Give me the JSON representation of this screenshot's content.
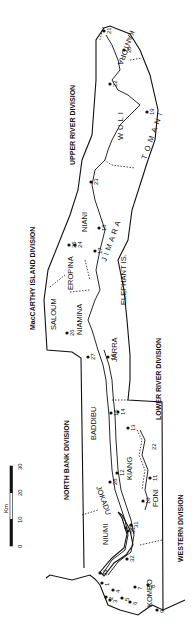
{
  "map": {
    "title": "The Gambia — Administrative Divisions",
    "orientation": "rotated 90deg counter-clockwise",
    "divisions": [
      {
        "name": "UPPER RIVER DIVISION",
        "x": 72,
        "y": 120
      },
      {
        "name": "MacCARTHY ISLAND DIVISION",
        "x": 32,
        "y": 270
      },
      {
        "name": "LOWER RIVER DIVISION",
        "x": 158,
        "y": 390
      },
      {
        "name": "NORTH BANK DIVISION",
        "x": 66,
        "y": 480
      },
      {
        "name": "WESTERN DIVISION",
        "x": 180,
        "y": 560
      }
    ],
    "regions": [
      {
        "name": "KANTORA",
        "x": 133,
        "y": 50
      },
      {
        "name": "WULI",
        "x": 120,
        "y": 125
      },
      {
        "name": "TOMANI",
        "x": 150,
        "y": 140
      },
      {
        "name": "NIANI",
        "x": 85,
        "y": 225
      },
      {
        "name": "JIMARA",
        "x": 112,
        "y": 245
      },
      {
        "name": "EROPINA",
        "x": 70,
        "y": 272
      },
      {
        "name": "ELEPHANT IS.",
        "x": 123,
        "y": 283
      },
      {
        "name": "SALOUM",
        "x": 55,
        "y": 325
      },
      {
        "name": "NIAMINA",
        "x": 80,
        "y": 310
      },
      {
        "name": "JARRA",
        "x": 115,
        "y": 355
      },
      {
        "name": "BADDIBU",
        "x": 93,
        "y": 420
      },
      {
        "name": "KIANG",
        "x": 130,
        "y": 468
      },
      {
        "name": "JOKADU",
        "x": 98,
        "y": 497
      },
      {
        "name": "NIUMI",
        "x": 105,
        "y": 537
      },
      {
        "name": "FONI",
        "x": 155,
        "y": 500
      },
      {
        "name": "KOMBO",
        "x": 150,
        "y": 595
      }
    ],
    "points": [
      {
        "id": "1",
        "x": 102,
        "y": 583
      },
      {
        "id": "2",
        "x": 106,
        "y": 597
      },
      {
        "id": "3",
        "x": 110,
        "y": 600
      },
      {
        "id": "4",
        "x": 113,
        "y": 590
      },
      {
        "id": "5",
        "x": 122,
        "y": 598
      },
      {
        "id": "6",
        "x": 130,
        "y": 602
      },
      {
        "id": "7",
        "x": 135,
        "y": 587
      },
      {
        "id": "8",
        "x": 148,
        "y": 585
      },
      {
        "id": "9",
        "x": 157,
        "y": 610
      },
      {
        "id": "10",
        "x": 143,
        "y": 501
      },
      {
        "id": "11",
        "x": 150,
        "y": 478
      },
      {
        "id": "12",
        "x": 117,
        "y": 473
      },
      {
        "id": "13",
        "x": 128,
        "y": 428
      },
      {
        "id": "14",
        "x": 118,
        "y": 412
      },
      {
        "id": "15",
        "x": 111,
        "y": 413
      },
      {
        "id": "16",
        "x": 108,
        "y": 357
      },
      {
        "id": "17",
        "x": 95,
        "y": 251
      },
      {
        "id": "18",
        "x": 99,
        "y": 228
      },
      {
        "id": "19",
        "x": 147,
        "y": 112
      },
      {
        "id": "20",
        "x": 124,
        "y": 50
      },
      {
        "id": "21",
        "x": 104,
        "y": 31
      },
      {
        "id": "22",
        "x": 110,
        "y": 84
      },
      {
        "id": "23",
        "x": 91,
        "y": 182
      },
      {
        "id": "24",
        "x": 75,
        "y": 245
      },
      {
        "id": "25",
        "x": 69,
        "y": 245
      },
      {
        "id": "26",
        "x": 67,
        "y": 333
      },
      {
        "id": "27",
        "x": 88,
        "y": 357
      },
      {
        "id": "28",
        "x": 110,
        "y": 482
      },
      {
        "id": "29",
        "x": 126,
        "y": 528
      },
      {
        "id": "30",
        "x": 128,
        "y": 531
      },
      {
        "id": "31",
        "x": 131,
        "y": 525
      },
      {
        "id": "32",
        "x": 127,
        "y": 559
      },
      {
        "id": "33",
        "x": 100,
        "y": 573
      }
    ],
    "region_number_22": {
      "id": "22",
      "x": 153,
      "y": 445
    },
    "scale_bar": {
      "unit": "Km",
      "ticks": [
        "0",
        "10",
        "20",
        "30"
      ]
    }
  }
}
